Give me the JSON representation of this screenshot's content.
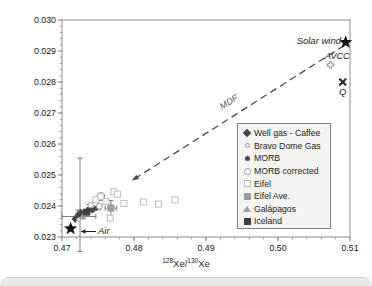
{
  "figure": {
    "background": "#ffffff",
    "axis_color": "#8c8c8c",
    "tick_label_color": "#161616"
  },
  "axes": {
    "x": {
      "sup1": "128",
      "mid1": "Xe/",
      "sup2": "130",
      "mid2": "Xe",
      "ticks": [
        "0.47",
        "0.48",
        "0.49",
        "0.50",
        "0.51"
      ],
      "range": [
        0.47,
        0.51
      ],
      "minor_step": 0.002
    },
    "y": {
      "sup1": "124",
      "mid1": "Xe/",
      "sup2": "130",
      "mid2": "Xe",
      "ticks": [
        "0.023",
        "0.024",
        "0.025",
        "0.026",
        "0.027",
        "0.028",
        "0.029",
        "0.030"
      ],
      "range": [
        0.023,
        0.03
      ],
      "minor_step": 0.0002
    }
  },
  "annotations": {
    "solar_wind": "Solar wind",
    "avcc": "AVCC",
    "q": "Q",
    "mdf": "MDF",
    "air": "Air"
  },
  "legend": {
    "items": [
      {
        "label": "Well gas - Caffee",
        "marker": "filled-diamond",
        "color": "#45454a"
      },
      {
        "label": "Bravo Dome Gas",
        "marker": "small-open-circle",
        "color": "#979797"
      },
      {
        "label": "MORB",
        "marker": "filled-circle",
        "color": "#45454a"
      },
      {
        "label": "MORB corrected",
        "marker": "open-circle",
        "color": "#9a9a9a"
      },
      {
        "label": "Eifel",
        "marker": "open-square",
        "color": "#bdbdbd"
      },
      {
        "label": "Eifel Ave.",
        "marker": "filled-gray-square",
        "color": "#9d9d9d"
      },
      {
        "label": "Galápagos",
        "marker": "filled-gray-triangle",
        "color": "#9d9d9d"
      },
      {
        "label": "Iceland",
        "marker": "filled-dark-square",
        "color": "#3e3e40"
      }
    ]
  },
  "chart_data": {
    "type": "scatter",
    "title": "",
    "xlabel": "128Xe/130Xe",
    "ylabel": "124Xe/130Xe",
    "xlim": [
      0.47,
      0.51
    ],
    "ylim": [
      0.023,
      0.03
    ],
    "grid": false,
    "legend_position": "inside lower right",
    "series": [
      {
        "name": "Air",
        "marker": "star",
        "color": "#111111",
        "points": [
          [
            0.4712,
            0.02327
          ]
        ]
      },
      {
        "name": "Solar wind",
        "marker": "star",
        "color": "#111111",
        "points": [
          [
            0.5094,
            0.02928
          ]
        ]
      },
      {
        "name": "AVCC",
        "marker": "open-plus",
        "color": "#8a8a8a",
        "points": [
          [
            0.5073,
            0.02855
          ]
        ]
      },
      {
        "name": "Q",
        "marker": "bold-x",
        "color": "#2e2e30",
        "points": [
          [
            0.509,
            0.028
          ]
        ]
      },
      {
        "name": "Well gas - Caffee",
        "marker": "filled-diamond",
        "color": "#45454a",
        "points": [
          [
            0.4718,
            0.02358
          ],
          [
            0.4722,
            0.02371
          ],
          [
            0.4726,
            0.02379
          ]
        ]
      },
      {
        "name": "Bravo Dome Gas",
        "marker": "small-open-circle",
        "color": "#979797",
        "points": [
          [
            0.4723,
            0.02356
          ]
        ]
      },
      {
        "name": "MORB",
        "marker": "filled-circle",
        "color": "#45454a",
        "points": [
          [
            0.4732,
            0.02382
          ],
          [
            0.4737,
            0.0239
          ],
          [
            0.4742,
            0.02386
          ],
          [
            0.4747,
            0.02393
          ]
        ]
      },
      {
        "name": "MORB corrected",
        "marker": "open-circle",
        "color": "#9a9a9a",
        "points": [
          [
            0.474,
            0.02403
          ],
          [
            0.4746,
            0.02409
          ],
          [
            0.4752,
            0.02399
          ]
        ]
      },
      {
        "name": "Eifel",
        "marker": "open-square",
        "color": "#bdbdbd",
        "points": [
          [
            0.4747,
            0.0242
          ],
          [
            0.4754,
            0.0243
          ],
          [
            0.4761,
            0.02414
          ],
          [
            0.4767,
            0.02361
          ],
          [
            0.4772,
            0.02446
          ],
          [
            0.4777,
            0.02438
          ],
          [
            0.4786,
            0.02408
          ],
          [
            0.4813,
            0.02413
          ],
          [
            0.4834,
            0.02406
          ],
          [
            0.4857,
            0.0242
          ]
        ]
      },
      {
        "name": "Eifel Ave.",
        "marker": "filled-gray-square",
        "color": "#9d9d9d",
        "points": [
          [
            0.4768,
            0.02393
          ]
        ]
      },
      {
        "name": "Galápagos",
        "marker": "filled-gray-triangle",
        "color": "#9d9d9d",
        "points": [
          [
            0.4729,
            0.02366
          ]
        ]
      },
      {
        "name": "Iceland",
        "marker": "filled-dark-square",
        "color": "#3e3e40",
        "points": [
          [
            0.4734,
            0.0238
          ]
        ]
      }
    ],
    "error_bars": [
      {
        "x": 0.4725,
        "y": 0.02372,
        "y_lo": 0.02253,
        "y_hi": 0.02555
      },
      {
        "x": 0.4723,
        "y": 0.02366,
        "x_lo": 0.47,
        "x_hi": 0.4747
      },
      {
        "x": 0.4768,
        "y": 0.02393,
        "x_lo": 0.476,
        "x_hi": 0.4776,
        "y_lo": 0.02368,
        "y_hi": 0.02418
      },
      {
        "x": 0.4754,
        "y": 0.0243,
        "x_lo": 0.4749,
        "x_hi": 0.4759,
        "y_lo": 0.02418,
        "y_hi": 0.02442
      },
      {
        "x": 0.4747,
        "y": 0.02393,
        "x_lo": 0.4741,
        "x_hi": 0.4753
      },
      {
        "x": 0.4737,
        "y": 0.0239,
        "y_lo": 0.02375,
        "y_hi": 0.02405
      },
      {
        "x": 0.4722,
        "y": 0.02371,
        "y_lo": 0.02355,
        "y_hi": 0.02387
      }
    ],
    "mdf_arrow": {
      "from": [
        0.5092,
        0.02918
      ],
      "to": [
        0.4797,
        0.02482
      ],
      "style": "dashed",
      "color": "#4a4a4a"
    },
    "air_arrow": {
      "from_px": [
        96,
        231.5
      ],
      "to_px": [
        81,
        231.5
      ],
      "color": "#1c1c1c"
    }
  }
}
